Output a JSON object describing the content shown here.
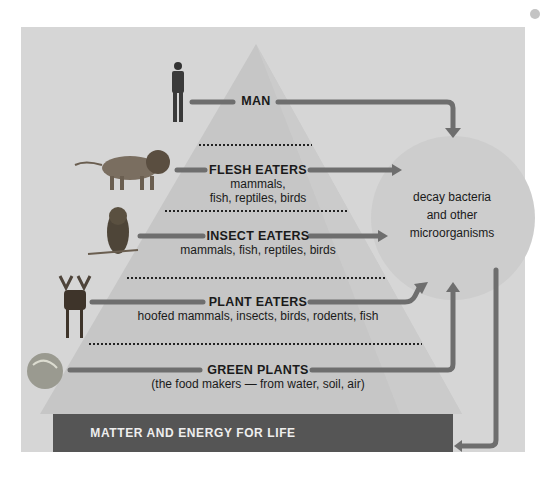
{
  "diagram": {
    "levels": [
      {
        "title": "MAN",
        "subtitle": "",
        "icon": "man-icon"
      },
      {
        "title": "FLESH EATERS",
        "subtitle_line1": "mammals,",
        "subtitle_line2": "fish, reptiles, birds",
        "icon": "lion-icon"
      },
      {
        "title": "INSECT EATERS",
        "subtitle": "mammals, fish, reptiles, birds",
        "icon": "owl-icon"
      },
      {
        "title": "PLANT EATERS",
        "subtitle": "hoofed mammals, insects, birds, rodents, fish",
        "icon": "moose-icon"
      },
      {
        "title": "GREEN PLANTS",
        "subtitle": "(the food makers — from water, soil, air)",
        "icon": "cabbage-icon"
      }
    ],
    "decomposers": {
      "line1": "decay bacteria",
      "line2": "and other",
      "line3": "microorganisms"
    },
    "base_label": "MATTER AND ENERGY FOR LIFE",
    "colors": {
      "background": "#d6d6d6",
      "pyramid": "#c4c4c4",
      "arrow": "#6e6e6e",
      "base": "#555555",
      "circle": "#cbcbcb"
    }
  }
}
